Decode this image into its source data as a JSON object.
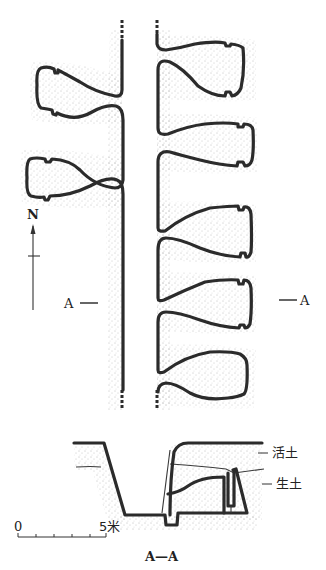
{
  "figure": {
    "type": "archaeological plan and section",
    "plan_view": {
      "north_label": "N",
      "section_marker_left": "A",
      "section_marker_right": "A",
      "corridor": "central passage with side chambers",
      "left_chamber_count": 2,
      "right_chamber_count": 5
    },
    "section_view": {
      "title": "A—A",
      "layer_labels": [
        {
          "text": "活土"
        },
        {
          "text": "生土"
        }
      ]
    },
    "scale_bar": {
      "start_label": "0",
      "end_label": "5米",
      "ticks": 6
    },
    "colors": {
      "line": "#2b2b2b",
      "stipple": "#6a6a6a",
      "background": "#ffffff"
    }
  }
}
